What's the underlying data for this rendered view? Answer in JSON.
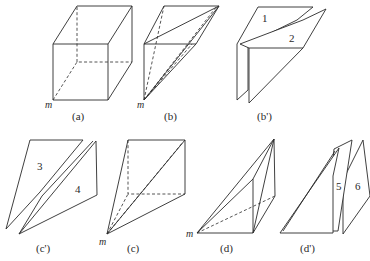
{
  "figure": {
    "vertex_label": "m",
    "panels": [
      {
        "id": "a",
        "caption": "(a)",
        "content": "cube with hidden edges dashed, vertex m at front-bottom-left"
      },
      {
        "id": "b",
        "caption": "(b)",
        "content": "triangular prism (half cube) with diagonals from m"
      },
      {
        "id": "b_prime",
        "caption": "(b')",
        "content": "prism split into pieces",
        "piece_labels": [
          "1",
          "2"
        ]
      },
      {
        "id": "c_prime",
        "caption": "(c')",
        "content": "pyramid split into pieces",
        "piece_labels": [
          "3",
          "4"
        ]
      },
      {
        "id": "c",
        "caption": "(c)",
        "content": "square pyramid with apex m"
      },
      {
        "id": "d",
        "caption": "(d)",
        "content": "triangular prism piece with vertex m"
      },
      {
        "id": "d_prime",
        "caption": "(d')",
        "content": "prism split into pieces",
        "piece_labels": [
          "5",
          "6"
        ]
      }
    ]
  }
}
